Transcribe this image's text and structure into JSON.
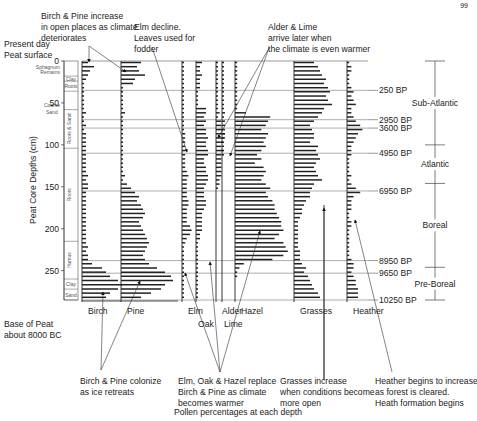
{
  "page_number": "99",
  "axis": {
    "ylabel": "Peat Core Depths (cm)",
    "xlabel": "Pollen percentages at each depth",
    "ticks": [
      {
        "label": "0",
        "depth": 0
      },
      {
        "label": "50",
        "depth": 50
      },
      {
        "label": "100",
        "depth": 100
      },
      {
        "label": "150",
        "depth": 150
      },
      {
        "label": "200",
        "depth": 200
      },
      {
        "label": "250",
        "depth": 250
      }
    ],
    "top_label_line1": "Present day",
    "top_label_line2": "Peat surface",
    "bottom_label_line1": "Base of Peat",
    "bottom_label_line2": "about 8000 BC"
  },
  "stratigraphy": [
    {
      "label": "Sphagnum Remains",
      "from": 0,
      "to": 18,
      "vertical": false
    },
    {
      "label": "Clay",
      "from": 18,
      "to": 24,
      "vertical": false
    },
    {
      "label": "Roots",
      "from": 24,
      "to": 36,
      "vertical": false
    },
    {
      "label": "Coarse Sand",
      "from": 50,
      "to": 58,
      "vertical": false
    },
    {
      "label": "Roots & Sand",
      "from": 58,
      "to": 104,
      "vertical": true
    },
    {
      "label": "Roots",
      "from": 104,
      "to": 215,
      "vertical": true
    },
    {
      "label": "Humus",
      "from": 215,
      "to": 260,
      "vertical": true
    },
    {
      "label": "Clay",
      "from": 260,
      "to": 272,
      "vertical": false
    },
    {
      "label": "Sand",
      "from": 272,
      "to": 285,
      "vertical": false
    }
  ],
  "taxa": [
    {
      "name": "Birch",
      "label_row": 1
    },
    {
      "name": "Pine",
      "label_row": 1
    },
    {
      "name": "Elm",
      "label_row": 1
    },
    {
      "name": "Oak",
      "label_row": 2
    },
    {
      "name": "Alder",
      "label_row": 1
    },
    {
      "name": "Lime",
      "label_row": 2
    },
    {
      "name": "Hazel",
      "label_row": 1
    },
    {
      "name": "Grasses",
      "label_row": 1
    },
    {
      "name": "Heather",
      "label_row": 1
    }
  ],
  "dates": [
    {
      "label": "250 BP",
      "depth": 35
    },
    {
      "label": "2950 BP",
      "depth": 70
    },
    {
      "label": "3600 BP",
      "depth": 80
    },
    {
      "label": "4950 BP",
      "depth": 110
    },
    {
      "label": "6950 BP",
      "depth": 155
    },
    {
      "label": "8950 BP",
      "depth": 238
    },
    {
      "label": "9650 BP",
      "depth": 253
    },
    {
      "label": "10250 BP",
      "depth": 285
    }
  ],
  "zones": [
    {
      "label": "Sub-Atlantic",
      "from": 0,
      "to": 100
    },
    {
      "label": "Atlantic",
      "from": 100,
      "to": 146
    },
    {
      "label": "Boreal",
      "from": 146,
      "to": 246
    },
    {
      "label": "Pre-Boreal",
      "from": 246,
      "to": 285
    }
  ],
  "annotations": {
    "birch_pine_increase": [
      "Birch & Pine increase",
      "in open places as climate",
      "deteriorates"
    ],
    "elm_decline": [
      "Elm decline.",
      "Leaves used for",
      "fodder"
    ],
    "alder_lime": [
      "Alder & Lime",
      "arrive later when",
      "the climate is even warmer"
    ],
    "birch_pine_colonize": [
      "Birch & Pine colonize",
      "as ice retreats"
    ],
    "elm_oak_hazel": [
      "Elm, Oak & Hazel replace",
      "Birch & Pine as climate",
      "becomes warmer"
    ],
    "grasses": [
      "Grasses increase",
      "when conditions become",
      "more open"
    ],
    "heather": [
      "Heather begins to increase",
      "as forest is cleared.",
      "Heath formation begins"
    ]
  },
  "chart_data": {
    "type": "pollen-diagram",
    "title": "",
    "xlabel": "Pollen percentages at each depth",
    "ylabel": "Peat Core Depths (cm)",
    "ylim": [
      0,
      285
    ],
    "depths": [
      0,
      5,
      10,
      15,
      20,
      25,
      30,
      35,
      40,
      45,
      50,
      55,
      60,
      65,
      70,
      75,
      80,
      85,
      90,
      95,
      100,
      105,
      110,
      115,
      120,
      125,
      130,
      135,
      140,
      145,
      150,
      155,
      160,
      165,
      170,
      175,
      180,
      185,
      190,
      195,
      200,
      205,
      210,
      215,
      220,
      225,
      230,
      235,
      240,
      245,
      250,
      255,
      260,
      265,
      270,
      275,
      280
    ],
    "series": [
      {
        "name": "Birch",
        "values": [
          3,
          6,
          4,
          3,
          2,
          1,
          1,
          1,
          1,
          1,
          1,
          1,
          2,
          1,
          1,
          2,
          1,
          2,
          2,
          2,
          2,
          2,
          2,
          2,
          2,
          2,
          2,
          3,
          2,
          3,
          3,
          2,
          2,
          2,
          2,
          2,
          2,
          2,
          2,
          2,
          2,
          2,
          2,
          2,
          3,
          2,
          3,
          3,
          5,
          10,
          12,
          14,
          18,
          20,
          18,
          14,
          12
        ]
      },
      {
        "name": "Pine",
        "values": [
          10,
          8,
          9,
          12,
          7,
          6,
          1,
          1,
          1,
          1,
          1,
          1,
          2,
          1,
          1,
          1,
          1,
          1,
          1,
          1,
          1,
          1,
          1,
          1,
          1,
          1,
          1,
          2,
          1,
          3,
          5,
          7,
          9,
          8,
          10,
          11,
          12,
          11,
          9,
          10,
          11,
          12,
          13,
          14,
          13,
          12,
          11,
          12,
          14,
          18,
          22,
          25,
          26,
          22,
          20,
          15,
          10
        ]
      },
      {
        "name": "Elm",
        "values": [
          1,
          1,
          1,
          1,
          1,
          1,
          1,
          1,
          1,
          1,
          1,
          1,
          1,
          1,
          1,
          1,
          1,
          2,
          2,
          2,
          2,
          2,
          2,
          2,
          2,
          2,
          3,
          4,
          3,
          3,
          3,
          3,
          3,
          4,
          4,
          3,
          3,
          3,
          3,
          5,
          6,
          5,
          3,
          2,
          1,
          1,
          1,
          1,
          1,
          1,
          1,
          1,
          1,
          1,
          1,
          1,
          1
        ]
      },
      {
        "name": "Oak",
        "values": [
          3,
          2,
          2,
          3,
          2,
          2,
          2,
          1,
          1,
          1,
          1,
          5,
          5,
          4,
          5,
          4,
          5,
          5,
          6,
          5,
          5,
          6,
          6,
          4,
          4,
          5,
          5,
          6,
          6,
          5,
          4,
          4,
          4,
          5,
          5,
          4,
          3,
          3,
          3,
          3,
          3,
          2,
          2,
          1,
          1,
          1,
          1,
          1,
          1,
          1,
          1,
          1,
          1,
          1,
          1,
          1,
          1
        ]
      },
      {
        "name": "Alder",
        "values": [
          1,
          1,
          1,
          1,
          1,
          1,
          1,
          1,
          1,
          1,
          1,
          1,
          2,
          1,
          3,
          3,
          4,
          5,
          5,
          4,
          3,
          4,
          3,
          3,
          3,
          3,
          3,
          3,
          2,
          2,
          1,
          0,
          0,
          0,
          0,
          0,
          0,
          0,
          0,
          0,
          0,
          0,
          0,
          0,
          0,
          0,
          0,
          0,
          0,
          0,
          0,
          0,
          0,
          0,
          0,
          0,
          0
        ]
      },
      {
        "name": "Lime",
        "values": [
          1,
          1,
          1,
          1,
          1,
          1,
          1,
          1,
          1,
          1,
          1,
          1,
          2,
          1,
          2,
          2,
          2,
          2,
          1,
          1,
          1,
          1,
          1,
          0,
          0,
          0,
          0,
          0,
          0,
          0,
          0,
          0,
          0,
          0,
          0,
          0,
          0,
          0,
          0,
          0,
          0,
          0,
          0,
          0,
          0,
          0,
          0,
          0,
          0,
          0,
          0,
          0,
          0,
          0,
          0,
          0,
          0
        ]
      },
      {
        "name": "Hazel",
        "values": [
          1,
          1,
          1,
          1,
          1,
          1,
          1,
          1,
          1,
          1,
          1,
          1,
          5,
          16,
          15,
          14,
          12,
          15,
          14,
          13,
          14,
          12,
          10,
          12,
          9,
          13,
          14,
          13,
          12,
          14,
          16,
          14,
          15,
          17,
          18,
          18,
          19,
          20,
          21,
          21,
          22,
          20,
          18,
          22,
          23,
          24,
          22,
          17,
          4,
          2,
          1,
          1,
          0,
          0,
          0,
          0,
          0
        ]
      },
      {
        "name": "Grasses",
        "values": [
          10,
          12,
          13,
          14,
          16,
          15,
          17,
          18,
          16,
          17,
          19,
          15,
          14,
          12,
          10,
          8,
          9,
          10,
          10,
          8,
          12,
          11,
          12,
          13,
          11,
          10,
          11,
          12,
          14,
          10,
          9,
          8,
          8,
          6,
          5,
          4,
          4,
          3,
          2,
          2,
          2,
          2,
          2,
          2,
          2,
          3,
          3,
          3,
          4,
          6,
          5,
          7,
          8,
          9,
          10,
          12,
          13
        ]
      },
      {
        "name": "Heather",
        "values": [
          1,
          2,
          2,
          1,
          1,
          1,
          2,
          3,
          2,
          3,
          4,
          2,
          2,
          3,
          4,
          6,
          7,
          5,
          4,
          3,
          2,
          2,
          2,
          1,
          1,
          1,
          1,
          2,
          1,
          2,
          4,
          6,
          3,
          2,
          2,
          2,
          1,
          1,
          2,
          2,
          1,
          1,
          1,
          1,
          1,
          1,
          1,
          2,
          3,
          3,
          2,
          3,
          4,
          4,
          5,
          5,
          5
        ]
      }
    ]
  }
}
